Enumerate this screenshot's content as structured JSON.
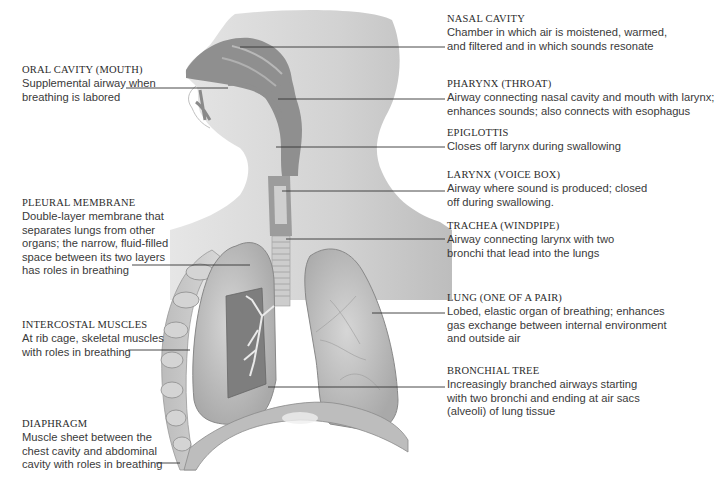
{
  "diagram": {
    "type": "anatomical-labeled-illustration",
    "colors": {
      "background": "#ffffff",
      "skin": "#d8d8d8",
      "airway_dark": "#8e8e8e",
      "lung": "#c4c4c4",
      "leader_line": "#333333",
      "text": "#333333"
    },
    "labels_left": [
      {
        "id": "oral-cavity",
        "title": "ORAL CAVITY (MOUTH)",
        "description": "Supplemental airway when\nbreathing is labored"
      },
      {
        "id": "pleural-membrane",
        "title": "PLEURAL MEMBRANE",
        "description": "Double-layer membrane that\nseparates lungs from other\norgans; the narrow, fluid-filled\nspace between its two layers\nhas roles in breathing"
      },
      {
        "id": "intercostal-muscles",
        "title": "INTERCOSTAL MUSCLES",
        "description": "At rib cage, skeletal muscles\nwith roles in breathing"
      },
      {
        "id": "diaphragm",
        "title": "DIAPHRAGM",
        "description": "Muscle sheet between the\nchest cavity and abdominal\ncavity with roles in breathing"
      }
    ],
    "labels_right": [
      {
        "id": "nasal-cavity",
        "title": "NASAL CAVITY",
        "description": "Chamber in which air is moistened, warmed,\nand filtered and in which sounds resonate"
      },
      {
        "id": "pharynx",
        "title": "PHARYNX (THROAT)",
        "description": "Airway connecting nasal cavity and mouth with larynx;\nenhances sounds; also connects with esophagus"
      },
      {
        "id": "epiglottis",
        "title": "EPIGLOTTIS",
        "description": "Closes off larynx during swallowing"
      },
      {
        "id": "larynx",
        "title": "LARYNX (VOICE BOX)",
        "description": "Airway where sound is produced; closed\noff during swallowing."
      },
      {
        "id": "trachea",
        "title": "TRACHEA (WINDPIPE)",
        "description": "Airway connecting larynx with two\nbronchi that lead into the lungs"
      },
      {
        "id": "lung",
        "title": "LUNG (ONE OF A PAIR)",
        "description": "Lobed, elastic organ of breathing; enhances\ngas exchange between internal environment\nand outside air"
      },
      {
        "id": "bronchial-tree",
        "title": "BRONCHIAL TREE",
        "description": "Increasingly branched airways starting\nwith two bronchi and ending at air sacs\n(alveoli) of lung tissue"
      }
    ]
  }
}
